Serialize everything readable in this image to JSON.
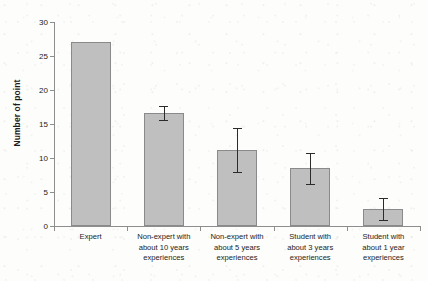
{
  "chart_data": {
    "type": "bar",
    "title": "",
    "xlabel": "",
    "ylabel": "Number of point",
    "ylim": [
      0,
      30
    ],
    "yticks": [
      0,
      5,
      10,
      15,
      20,
      25,
      30
    ],
    "ytick_labels": [
      "0",
      "5",
      "10",
      "15",
      "20",
      "25",
      "30"
    ],
    "grid": false,
    "legend": null,
    "categories": [
      "Expert",
      "Non-expert with about 10 years experiences",
      "Non-expert with about 5 years experiences",
      "Student with about 3 years experiences",
      "Student with about 1 year experiences"
    ],
    "category_lines": [
      [
        "Expert"
      ],
      [
        "Non-expert with",
        "about 10 years",
        "experiences"
      ],
      [
        "Non-expert with",
        "about 5 years",
        "experiences"
      ],
      [
        "Student with",
        "about 3 years",
        "experiences"
      ],
      [
        "Student with",
        "about 1 year",
        "experiences"
      ]
    ],
    "values": [
      27.0,
      16.6,
      11.2,
      8.5,
      2.5
    ],
    "errors": [
      0,
      1.0,
      3.2,
      2.3,
      1.6
    ],
    "error_upper": [
      27.0,
      17.6,
      14.4,
      10.8,
      4.1
    ],
    "error_lower": [
      27.0,
      15.6,
      8.0,
      6.2,
      0.9
    ],
    "bar_color": "#bfbfbf",
    "bar_border_color": "#8a8a8a",
    "errorbar_color": "#2b2b2b",
    "axis_color": "#8d8d8d",
    "text_color": "#1c1c1c",
    "background_color": "#fdfdfb"
  }
}
